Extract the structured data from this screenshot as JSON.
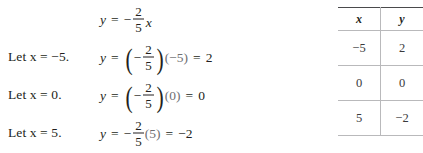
{
  "figure": {
    "text_color": "#231f20",
    "light_text_color": "#6f6f72",
    "rule_color": "#b9b9bb"
  },
  "work": {
    "rows": [
      {
        "let_label": "",
        "lhs": "y",
        "equals": "=",
        "sign": "−",
        "fraction": {
          "numerator": "2",
          "denominator": "5"
        },
        "has_parentheses": false,
        "multiplier": "x",
        "multiplier_is_variable": true,
        "result_equals": "",
        "result": ""
      },
      {
        "let_label": "Let x = −5.",
        "let_prefix": "Let",
        "let_var": "x",
        "let_equals": "=",
        "let_value": "−5.",
        "lhs": "y",
        "equals": "=",
        "sign": "−",
        "fraction": {
          "numerator": "2",
          "denominator": "5"
        },
        "has_parentheses": true,
        "multiplier": "(−5)",
        "multiplier_is_variable": false,
        "result_equals": "=",
        "result": "2"
      },
      {
        "let_label": "Let x = 0.",
        "let_prefix": "Let",
        "let_var": "x",
        "let_equals": "=",
        "let_value": "0.",
        "lhs": "y",
        "equals": "=",
        "sign": "−",
        "fraction": {
          "numerator": "2",
          "denominator": "5"
        },
        "has_parentheses": true,
        "multiplier": "(0)",
        "multiplier_is_variable": false,
        "result_equals": "=",
        "result": "0"
      },
      {
        "let_label": "Let x = 5.",
        "let_prefix": "Let",
        "let_var": "x",
        "let_equals": "=",
        "let_value": "5.",
        "lhs": "y",
        "equals": "=",
        "sign": "−",
        "fraction": {
          "numerator": "2",
          "denominator": "5"
        },
        "has_parentheses": false,
        "multiplier": "(5)",
        "multiplier_is_variable": false,
        "result_equals": "=",
        "result": "−2"
      }
    ]
  },
  "table": {
    "headers": [
      "x",
      "y"
    ],
    "rows": [
      [
        "−5",
        "2"
      ],
      [
        "0",
        "0"
      ],
      [
        "5",
        "−2"
      ]
    ]
  }
}
